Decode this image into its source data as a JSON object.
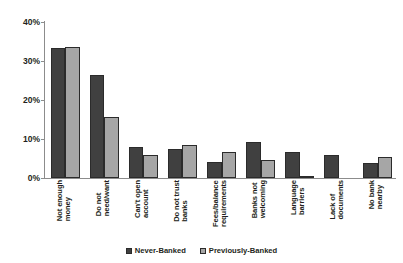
{
  "chart_data": {
    "type": "bar",
    "title": "",
    "xlabel": "",
    "ylabel": "",
    "ylim": [
      0,
      40
    ],
    "ytick_labels": [
      "0%",
      "10%",
      "20%",
      "30%",
      "40%"
    ],
    "ytick_values": [
      0,
      10,
      20,
      30,
      40
    ],
    "grid": false,
    "legend_position": "bottom",
    "categories": [
      "Not enough money",
      "Do not need/want",
      "Can't open account",
      "Do not trust banks",
      "Fees/balance requirements",
      "Banks not welcoming",
      "Language barriers",
      "Lack of documents",
      "No bank nearby"
    ],
    "category_lines": [
      [
        "Not enough",
        "money"
      ],
      [
        "Do not",
        "need/want"
      ],
      [
        "Can't open",
        "account"
      ],
      [
        "Do not trust",
        "banks"
      ],
      [
        "Fees/balance",
        "requirements"
      ],
      [
        "Banks not",
        "welcoming"
      ],
      [
        "Language",
        "barriers"
      ],
      [
        "Lack of",
        "documents"
      ],
      [
        "No bank",
        "nearby"
      ]
    ],
    "series": [
      {
        "name": "Never-Banked",
        "color": "#404040",
        "values": [
          33.3,
          26.4,
          8.0,
          7.5,
          4.1,
          9.2,
          6.7,
          5.9,
          3.8
        ]
      },
      {
        "name": "Previously-Banked",
        "color": "#a6a6a6",
        "values": [
          33.6,
          15.6,
          6.0,
          8.4,
          6.7,
          4.6,
          0.4,
          0.0,
          5.4
        ]
      }
    ]
  },
  "legend": {
    "items": [
      {
        "label": "Never-Banked",
        "color": "#404040"
      },
      {
        "label": "Previously-Banked",
        "color": "#a6a6a6"
      }
    ]
  }
}
